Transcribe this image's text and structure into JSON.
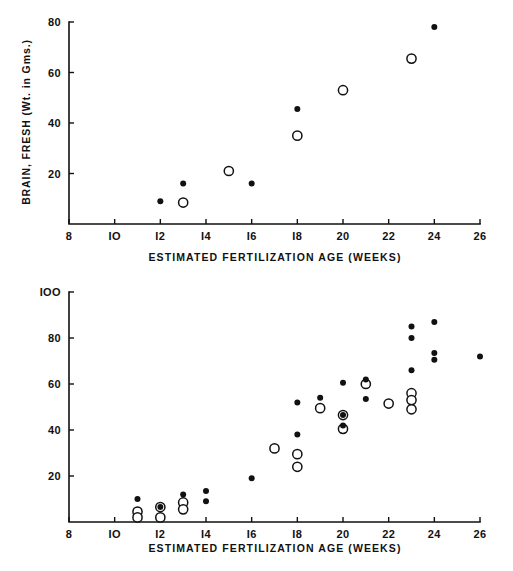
{
  "figure": {
    "background_color": "#ffffff",
    "ink_color": "#111111",
    "panel_count": 2
  },
  "chart_data": [
    {
      "id": "brain-fresh",
      "type": "scatter",
      "title": "",
      "xlabel": "ESTIMATED FERTILIZATION AGE (WEEKS)",
      "ylabel": "BRAIN, FRESH (Wt. in Gms.)",
      "xlim": [
        8,
        26
      ],
      "ylim": [
        0,
        80
      ],
      "xticks": [
        8,
        10,
        12,
        14,
        16,
        18,
        20,
        22,
        24,
        26
      ],
      "xticklabels": [
        "8",
        "IO",
        "I2",
        "I4",
        "I6",
        "I8",
        "20",
        "22",
        "24",
        "26"
      ],
      "yticks": [
        20,
        40,
        60,
        80
      ],
      "yticklabels": [
        "20",
        "40",
        "60",
        "80"
      ],
      "grid": false,
      "legend": "none",
      "series": [
        {
          "name": "filled-circle",
          "marker": "filled-circle",
          "marker_radius": 3.0,
          "points": [
            {
              "x": 12.0,
              "y": 9.0
            },
            {
              "x": 13.0,
              "y": 16.0
            },
            {
              "x": 16.0,
              "y": 16.0
            },
            {
              "x": 18.0,
              "y": 45.5
            },
            {
              "x": 24.0,
              "y": 78.0
            }
          ]
        },
        {
          "name": "open-circle",
          "marker": "open-circle",
          "marker_radius": 4.6,
          "points": [
            {
              "x": 13.0,
              "y": 8.5
            },
            {
              "x": 15.0,
              "y": 21.0
            },
            {
              "x": 18.0,
              "y": 35.0
            },
            {
              "x": 20.0,
              "y": 53.0
            },
            {
              "x": 23.0,
              "y": 65.5
            }
          ]
        }
      ]
    },
    {
      "id": "brain-fixed",
      "type": "scatter",
      "title": "",
      "xlabel": "ESTIMATED FERTILIZATION AGE (WEEKS)",
      "ylabel": "BRAIN, FIXED (Wt. in Gms.)",
      "xlim": [
        8,
        26
      ],
      "ylim": [
        0,
        100
      ],
      "xticks": [
        8,
        10,
        12,
        14,
        16,
        18,
        20,
        22,
        24,
        26
      ],
      "xticklabels": [
        "8",
        "IO",
        "I2",
        "I4",
        "I6",
        "I8",
        "20",
        "22",
        "24",
        "26"
      ],
      "yticks": [
        20,
        40,
        60,
        80,
        100
      ],
      "yticklabels": [
        "20",
        "40",
        "60",
        "80",
        "IOO"
      ],
      "grid": false,
      "legend": "none",
      "series": [
        {
          "name": "filled-circle",
          "marker": "filled-circle",
          "marker_radius": 3.0,
          "points": [
            {
              "x": 11.0,
              "y": 10.0
            },
            {
              "x": 12.0,
              "y": 6.5
            },
            {
              "x": 13.0,
              "y": 12.0
            },
            {
              "x": 14.0,
              "y": 13.5
            },
            {
              "x": 14.0,
              "y": 9.0
            },
            {
              "x": 16.0,
              "y": 19.0
            },
            {
              "x": 18.0,
              "y": 52.0
            },
            {
              "x": 18.0,
              "y": 38.0
            },
            {
              "x": 19.0,
              "y": 54.0
            },
            {
              "x": 20.0,
              "y": 60.5
            },
            {
              "x": 20.0,
              "y": 46.5
            },
            {
              "x": 20.0,
              "y": 42.0
            },
            {
              "x": 21.0,
              "y": 62.0
            },
            {
              "x": 21.0,
              "y": 53.5
            },
            {
              "x": 23.0,
              "y": 85.0
            },
            {
              "x": 23.0,
              "y": 80.0
            },
            {
              "x": 23.0,
              "y": 66.0
            },
            {
              "x": 24.0,
              "y": 87.0
            },
            {
              "x": 24.0,
              "y": 73.5
            },
            {
              "x": 24.0,
              "y": 70.5
            },
            {
              "x": 26.0,
              "y": 72.0
            }
          ]
        },
        {
          "name": "open-circle",
          "marker": "open-circle",
          "marker_radius": 4.6,
          "points": [
            {
              "x": 11.0,
              "y": 4.5
            },
            {
              "x": 11.0,
              "y": 2.0
            },
            {
              "x": 12.0,
              "y": 6.5
            },
            {
              "x": 12.0,
              "y": 2.0
            },
            {
              "x": 13.0,
              "y": 8.5
            },
            {
              "x": 13.0,
              "y": 5.5
            },
            {
              "x": 17.0,
              "y": 32.0
            },
            {
              "x": 18.0,
              "y": 29.5
            },
            {
              "x": 18.0,
              "y": 24.0
            },
            {
              "x": 19.0,
              "y": 49.5
            },
            {
              "x": 20.0,
              "y": 46.5
            },
            {
              "x": 20.0,
              "y": 40.5
            },
            {
              "x": 21.0,
              "y": 60.0
            },
            {
              "x": 22.0,
              "y": 51.5
            },
            {
              "x": 23.0,
              "y": 56.0
            },
            {
              "x": 23.0,
              "y": 53.0
            },
            {
              "x": 23.0,
              "y": 49.0
            }
          ]
        }
      ]
    }
  ]
}
